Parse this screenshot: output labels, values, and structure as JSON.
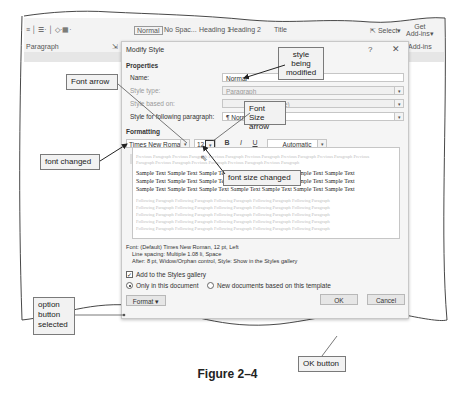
{
  "ribbon": {
    "group_paragraph": "Paragraph",
    "styles": [
      "Normal",
      "No Spac...",
      "Heading 1",
      "Heading 2",
      "Title"
    ],
    "select_label": "Select",
    "get_addins_line1": "Get",
    "get_addins_line2": "Add-ins",
    "addins_group": "Add-ins"
  },
  "dialog": {
    "title": "Modify Style",
    "help": "?",
    "close": "✕",
    "properties_heading": "Properties",
    "name_label": "Name:",
    "name_value": "Normal",
    "style_type_label": "Style type:",
    "style_type_value": "Paragraph",
    "style_based_label": "Style based on:",
    "style_based_value": "(no style)",
    "following_label": "Style for following paragraph:",
    "following_value": "¶ Normal",
    "formatting_heading": "Formatting",
    "font_value": "Times New Roman",
    "font_size_value": "12",
    "bold": "B",
    "italic": "I",
    "underline": "U",
    "color_value": "Automatic",
    "preview": {
      "previous": "Previous Paragraph Previous Paragraph Previous Paragraph Previous Paragraph Previous Paragraph Previous Paragraph Previous",
      "previous2": "Paragraph Previous Paragraph Previous Paragraph Previous Paragraph Previous Paragraph",
      "sample_line": "Sample Text Sample Text Sample Text Sample Text Sample Text Sample Text Sample Text",
      "following": "Following Paragraph Following Paragraph Following Paragraph Following Paragraph Following Paragraph"
    },
    "description_line1": "Font: (Default) Times New Roman, 12 pt, Left",
    "description_line2": "Line spacing:  Multiple 1.08 li, Space",
    "description_line3": "After:  8 pt, Widow/Orphan control, Style: Show in the Styles gallery",
    "add_to_gallery_label": "Add to the Styles gallery",
    "only_this_doc_label": "Only in this document",
    "new_docs_label": "New documents based on this template",
    "format_button": "Format ▾",
    "ok_button": "OK",
    "cancel_button": "Cancel"
  },
  "callouts": {
    "style_modified": "style being modified",
    "font_arrow": "Font arrow",
    "font_size_arrow": "Font Size arrow",
    "font_changed": "font changed",
    "font_size_changed": "font size changed",
    "option_selected": "option button selected",
    "ok_button": "OK button"
  },
  "caption": "Figure 2–4"
}
